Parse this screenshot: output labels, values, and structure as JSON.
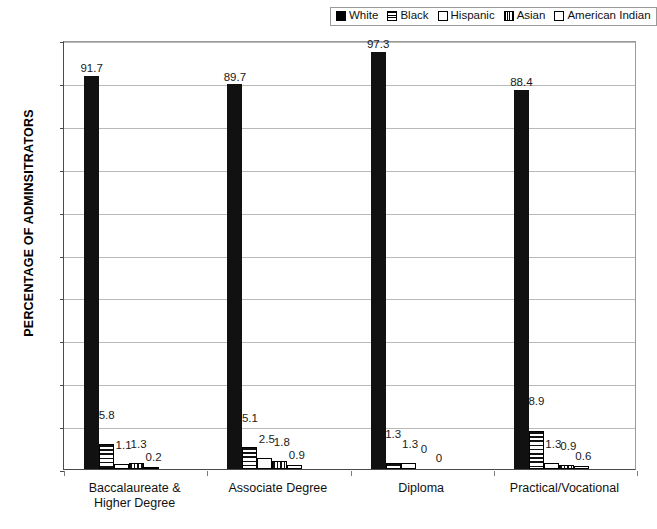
{
  "chart_data": {
    "type": "bar",
    "title": "",
    "xlabel": "",
    "ylabel": "PERCENTAGE OF ADMINSITRATORS",
    "ylim": [
      0,
      100
    ],
    "ytick_labels": [
      "100",
      "90",
      "80",
      "70",
      "60",
      "50",
      "40",
      "30",
      "20",
      "10",
      "0"
    ],
    "ytick_values": [
      100,
      90,
      80,
      70,
      60,
      50,
      40,
      30,
      20,
      10,
      0
    ],
    "grid": true,
    "legend_position": "top-right",
    "categories": [
      "Baccalaureate & Higher Degree",
      "Associate Degree",
      "Diploma",
      "Practical/Vocational"
    ],
    "category_lines": [
      [
        "Baccalaureate &",
        "Higher Degree"
      ],
      [
        "Associate Degree"
      ],
      [
        "Diploma"
      ],
      [
        "Practical/Vocational"
      ]
    ],
    "series": [
      {
        "name": "White",
        "pattern": "solid",
        "values": [
          91.7,
          89.7,
          97.3,
          88.4
        ],
        "labels": [
          "91.7",
          "89.7",
          "97.3",
          "88.4"
        ]
      },
      {
        "name": "Black",
        "pattern": "hstripe",
        "values": [
          5.8,
          5.1,
          1.3,
          8.9
        ],
        "labels": [
          "5.8",
          "5.1",
          "1.3",
          "8.9"
        ]
      },
      {
        "name": "Hispanic",
        "pattern": "empty",
        "values": [
          1.1,
          2.5,
          1.3,
          1.3
        ],
        "labels": [
          "1.1",
          "2.5",
          "1.3",
          "1.3"
        ]
      },
      {
        "name": "Asian",
        "pattern": "vstripe",
        "values": [
          1.3,
          1.8,
          0,
          0.9
        ],
        "labels": [
          "1.3",
          "1.8",
          "0",
          "0.9"
        ]
      },
      {
        "name": "American Indian",
        "pattern": "empty",
        "values": [
          0.2,
          0.9,
          0,
          0.6
        ],
        "labels": [
          "0.2",
          "0.9",
          "0",
          "0.6"
        ]
      }
    ]
  },
  "legend": {
    "items": [
      {
        "label": "White",
        "swatch": "sw-solid"
      },
      {
        "label": "Black",
        "swatch": "sw-hstripe"
      },
      {
        "label": "Hispanic",
        "swatch": "sw-empty"
      },
      {
        "label": "Asian",
        "swatch": "sw-vstripe"
      },
      {
        "label": "American Indian",
        "swatch": "sw-empty"
      }
    ]
  }
}
